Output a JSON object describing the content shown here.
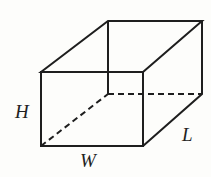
{
  "figure": {
    "type": "rectangular-prism",
    "labels": {
      "height": "H",
      "width": "W",
      "length": "L"
    },
    "colors": {
      "stroke": "#1e1e1e",
      "background": "#fdfdfb"
    }
  }
}
